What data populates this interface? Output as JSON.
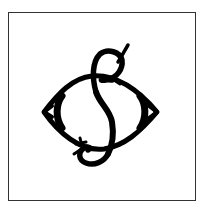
{
  "image": {
    "subject": "monogram-logo",
    "description": "Decorative interlaced monogram with an S-like stroke through a pointed ring",
    "colors": {
      "background": "#ffffff",
      "ink": "#000000",
      "frame": "#333333"
    }
  }
}
